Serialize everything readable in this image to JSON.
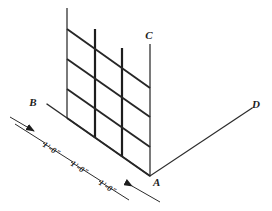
{
  "drawing": {
    "type": "isometric-line-drawing",
    "subject": "reinforcing mesh grid panel on isometric axes",
    "background_color": "#ffffff",
    "line_color": "#262626",
    "width": 272,
    "height": 211
  },
  "axes": [
    {
      "id": "A",
      "label": "A",
      "role": "origin-point",
      "x": 150,
      "y": 176
    },
    {
      "id": "B",
      "label": "B",
      "role": "left-receding-axis-end",
      "x": 37,
      "y": 102
    },
    {
      "id": "C",
      "label": "C",
      "role": "vertical-axis-top",
      "x": 149,
      "y": 36
    },
    {
      "id": "D",
      "label": "D",
      "role": "right-receding-axis-end",
      "x": 256,
      "y": 105
    }
  ],
  "dimensions": [
    {
      "id": "dim-1",
      "value": "1'-0\"",
      "position": "left-bay"
    },
    {
      "id": "dim-2",
      "value": "1'-0\"",
      "position": "middle-bay"
    },
    {
      "id": "dim-3",
      "value": "1'-0\"",
      "position": "right-bay"
    }
  ],
  "grid": {
    "vertical_posts": 4,
    "horizontal_rails": 4,
    "bays": 3
  }
}
